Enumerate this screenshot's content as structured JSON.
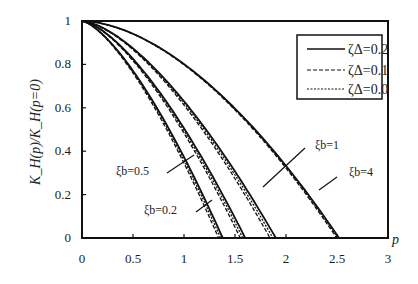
{
  "chart_data": {
    "type": "line",
    "title": "",
    "xlabel": "p",
    "ylabel": "K_H(p)/K_H(p=0)",
    "xlim": [
      0,
      3
    ],
    "ylim": [
      0,
      1
    ],
    "grid": false,
    "legend_position": "upper right (inside)",
    "x_ticks": [
      "0",
      "0.5",
      "1",
      "1.5",
      "2",
      "2.5",
      "3"
    ],
    "y_ticks": [
      "0",
      "0.2",
      "0.4",
      "0.6",
      "0.8",
      "1"
    ],
    "legend": [
      {
        "label": "ζΔ=0.2",
        "style": "solid"
      },
      {
        "label": "ζΔ=0.1",
        "style": "dashed"
      },
      {
        "label": "ζΔ=0.0",
        "style": "dotted"
      }
    ],
    "curve_groups": [
      {
        "name": "ξb=0.2",
        "p_zero": 1.38,
        "exponent": 1.45
      },
      {
        "name": "ξb=0.5",
        "p_zero": 1.6,
        "exponent": 1.5
      },
      {
        "name": "ξb=1",
        "p_zero": 1.9,
        "exponent": 1.55
      },
      {
        "name": "ξb=4",
        "p_zero": 2.52,
        "exponent": 1.75
      }
    ],
    "annotations": [
      "ξb=0.5",
      "ξb=0.2",
      "ξb=1",
      "ξb=4"
    ]
  },
  "labels": {
    "xlabel": "p",
    "ylabel": "K_H(p)/K_H(p=0)",
    "legend": [
      "ζΔ=0.2",
      "ζΔ=0.1",
      "ζΔ=0.0"
    ],
    "curves": [
      "ξb=0.5",
      "ξb=0.2",
      "ξb=1",
      "ξb=4"
    ]
  }
}
